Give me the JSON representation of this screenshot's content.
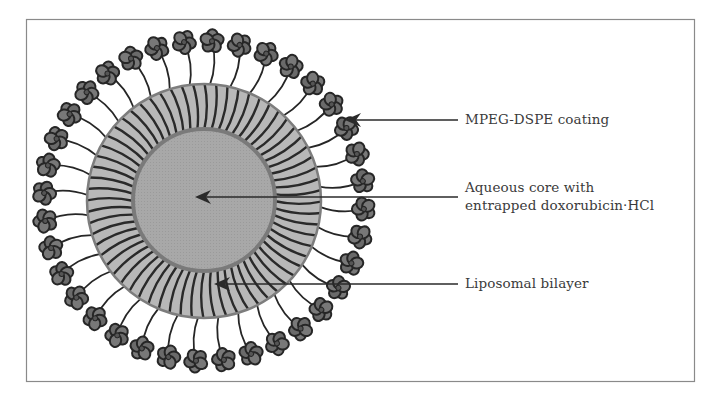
{
  "diagram": {
    "colors": {
      "frame": "#8a8a8a",
      "bilayer_fill": "#b8b8b8",
      "bilayer_stripe": "#2a2a2a",
      "bilayer_rim": "#7d7d7d",
      "core_fill": "#a6a6a6",
      "core_rim": "#7a7a7a",
      "peg_fill": "#6e6e6e",
      "peg_outline": "#262626",
      "arrow": "#2a2a2a",
      "text": "#3a3a3a"
    },
    "labels": {
      "coating": "MPEG-DSPE coating",
      "core_line1": "Aqueous core with",
      "core_line2": "entrapped doxorubicin·HCl",
      "bilayer": "Liposomal bilayer"
    },
    "components": [
      {
        "id": "coating",
        "name": "MPEG-DSPE coating",
        "count_estimate": 36
      },
      {
        "id": "bilayer",
        "name": "Liposomal bilayer"
      },
      {
        "id": "core",
        "name": "Aqueous core with entrapped doxorubicin·HCl"
      }
    ]
  }
}
